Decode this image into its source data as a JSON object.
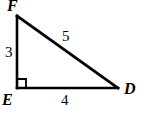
{
  "figure": {
    "type": "right-triangle-diagram",
    "background_color": "#ffffff",
    "stroke_color": "#000000",
    "vertices": [
      {
        "name": "F",
        "label": "F",
        "x": 17,
        "y": 16,
        "position": "top-left"
      },
      {
        "name": "E",
        "label": "E",
        "x": 17,
        "y": 88,
        "position": "bottom-left"
      },
      {
        "name": "D",
        "label": "D",
        "x": 118,
        "y": 88,
        "position": "bottom-right"
      }
    ],
    "right_angle": {
      "at_vertex": "E",
      "marker": "square",
      "size": 9
    },
    "sides": [
      {
        "name": "leg-vertical",
        "from": "E",
        "to": "F",
        "label": "3"
      },
      {
        "name": "leg-horizontal",
        "from": "E",
        "to": "D",
        "label": "4"
      },
      {
        "name": "hypotenuse",
        "from": "F",
        "to": "D",
        "label": "5"
      }
    ]
  }
}
